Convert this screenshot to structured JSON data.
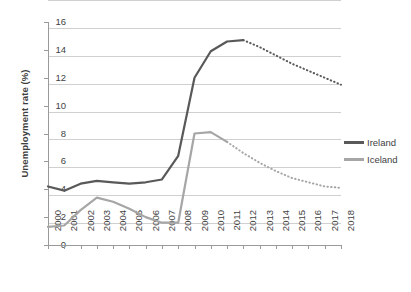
{
  "chart_data": {
    "type": "line",
    "title": "",
    "xlabel": "",
    "ylabel": "Unemployment rate (%)",
    "ylim": [
      0,
      16
    ],
    "ytick_step": 2,
    "yticks": [
      "16",
      "14",
      "12",
      "10",
      "8",
      "6",
      "4",
      "2",
      "0"
    ],
    "grid": "horizontal",
    "legend_position": "right",
    "categories": [
      "2000",
      "2001",
      "2002",
      "2003",
      "2004",
      "2005",
      "2006",
      "2007",
      "2008",
      "2009",
      "2010",
      "2011",
      "2012",
      "2013",
      "2014",
      "2015",
      "2016",
      "2017",
      "2018"
    ],
    "x": [
      2000,
      2001,
      2002,
      2003,
      2004,
      2005,
      2006,
      2007,
      2008,
      2009,
      2010,
      2011,
      2012,
      2013,
      2014,
      2015,
      2016,
      2017,
      2018
    ],
    "series": [
      {
        "name": "Ireland",
        "color": "#595959",
        "values": [
          4.2,
          3.9,
          4.4,
          4.6,
          4.5,
          4.4,
          4.5,
          4.7,
          6.4,
          12.0,
          13.9,
          14.6,
          14.7,
          14.2,
          13.6,
          13.0,
          12.5,
          12.0,
          11.5
        ],
        "solid_through": 2012,
        "projection_style": "dotted"
      },
      {
        "name": "Iceland",
        "color": "#a6a6a6",
        "values": [
          1.3,
          1.4,
          2.5,
          3.4,
          3.1,
          2.6,
          2.0,
          1.6,
          1.6,
          8.0,
          8.1,
          7.4,
          6.6,
          5.9,
          5.3,
          4.8,
          4.5,
          4.2,
          4.1
        ],
        "solid_through": 2011,
        "projection_style": "dotted"
      }
    ]
  },
  "legend": {
    "items": [
      {
        "label": "Ireland",
        "color": "#595959"
      },
      {
        "label": "Iceland",
        "color": "#a6a6a6"
      }
    ]
  }
}
